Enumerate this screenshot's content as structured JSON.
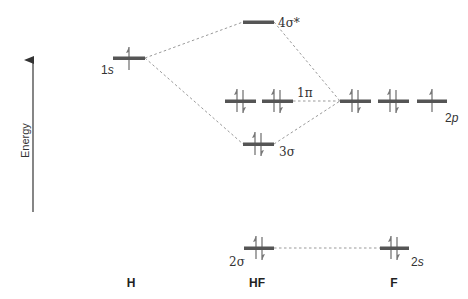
{
  "axis": {
    "label": "Energy",
    "arrow": {
      "x": 33,
      "y_bottom": 212,
      "y_top": 57
    }
  },
  "colors": {
    "level_bar": "#555555",
    "electron_arrow": "#777777",
    "connector": "#999999",
    "text": "#333333",
    "background": "#ffffff"
  },
  "species": [
    {
      "id": "H",
      "label": "H",
      "x": 131,
      "y": 287
    },
    {
      "id": "HF",
      "label": "HF",
      "x": 256,
      "y": 287
    },
    {
      "id": "F",
      "label": "F",
      "x": 394,
      "y": 287
    }
  ],
  "levels": [
    {
      "id": "H-1s",
      "label": "1s",
      "label_num": "1",
      "label_sub": "s",
      "x1": 113,
      "x2": 145,
      "y": 58,
      "electrons": 1,
      "label_x": 101,
      "label_y": 74
    },
    {
      "id": "HF-4sigma-star",
      "label": "4σ*",
      "x1": 243,
      "x2": 274,
      "y": 22,
      "electrons": 0,
      "label_x": 279,
      "label_y": 26
    },
    {
      "id": "HF-1pi-a",
      "label": "",
      "x1": 225,
      "x2": 256,
      "y": 101,
      "electrons": 2
    },
    {
      "id": "HF-1pi-b",
      "label": "1π",
      "x1": 262,
      "x2": 293,
      "y": 101,
      "electrons": 2,
      "label_x": 297,
      "label_y": 97
    },
    {
      "id": "HF-3sigma",
      "label": "3σ",
      "x1": 243,
      "x2": 274,
      "y": 144,
      "electrons": 2,
      "label_x": 280,
      "label_y": 155
    },
    {
      "id": "HF-2sigma",
      "label": "2σ",
      "x1": 244,
      "x2": 274,
      "y": 248,
      "electrons": 2,
      "label_x": 229,
      "label_y": 265
    },
    {
      "id": "F-2p-a",
      "label": "",
      "x1": 340,
      "x2": 371,
      "y": 101,
      "electrons": 2
    },
    {
      "id": "F-2p-b",
      "label": "",
      "x1": 378,
      "x2": 409,
      "y": 101,
      "electrons": 2
    },
    {
      "id": "F-2p-c",
      "label": "2p",
      "x1": 417,
      "x2": 447,
      "y": 101,
      "electrons": 1,
      "label_x": 446,
      "label_y": 122
    },
    {
      "id": "F-2s",
      "label": "2s",
      "x1": 380,
      "x2": 409,
      "y": 248,
      "electrons": 2,
      "label_x": 412,
      "label_y": 265
    }
  ],
  "connectors": [
    {
      "from": "H-1s",
      "to": "HF-4sigma-star",
      "x1": 145,
      "y1": 58,
      "x2": 243,
      "y2": 22
    },
    {
      "from": "H-1s",
      "to": "HF-3sigma",
      "x1": 145,
      "y1": 58,
      "x2": 243,
      "y2": 144
    },
    {
      "from": "HF-4sigma-star",
      "to": "F-2p",
      "x1": 274,
      "y1": 22,
      "x2": 340,
      "y2": 101
    },
    {
      "from": "HF-3sigma",
      "to": "F-2p",
      "x1": 274,
      "y1": 144,
      "x2": 340,
      "y2": 101
    },
    {
      "from": "HF-1pi",
      "to": "F-2p",
      "x1": 293,
      "y1": 101,
      "x2": 340,
      "y2": 101
    },
    {
      "from": "HF-2sigma",
      "to": "F-2s",
      "x1": 274,
      "y1": 248,
      "x2": 380,
      "y2": 248
    }
  ],
  "labels": {
    "energy": "Energy",
    "h_1s_num": "1",
    "h_1s_sub": "s",
    "sigma4_star": "4σ*",
    "pi1": "1π",
    "f_2p_num": "2",
    "f_2p_sub": "p",
    "sigma3": "3σ",
    "sigma2": "2σ",
    "f_2s_num": "2",
    "f_2s_sub": "s",
    "species_h": "H",
    "species_hf": "HF",
    "species_f": "F"
  }
}
